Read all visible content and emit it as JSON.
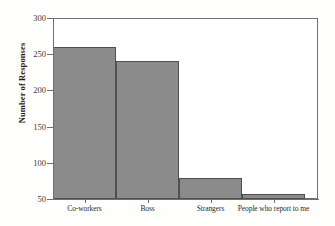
{
  "chart_data": {
    "type": "bar",
    "title": "",
    "subtitle": "",
    "xlabel": "",
    "ylabel": "Number of Responses",
    "categories": [
      "Co-workers",
      "Boss",
      "Strangers",
      "People who report to me"
    ],
    "values": [
      260,
      241,
      79,
      57
    ],
    "series": [
      {
        "name": "Number of Responses",
        "values": [
          260,
          241,
          79,
          57
        ]
      }
    ],
    "ylim": [
      50,
      300
    ],
    "yticks": [
      50,
      100,
      150,
      200,
      250,
      300
    ],
    "ytick_labels": [
      "50",
      "100",
      "150",
      "200",
      "250",
      "300"
    ],
    "grid": false,
    "legend": false,
    "legend_position": "none",
    "bar_color": "#8b8b8b",
    "bar_edge_color": "#4f4f4f",
    "axis_color": "#6f6f6f",
    "background_color": "#fefefc",
    "annotations": []
  }
}
